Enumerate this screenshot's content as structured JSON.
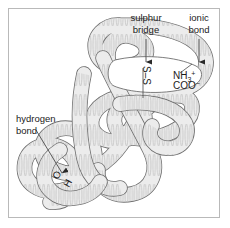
{
  "figure": {
    "type": "diagram",
    "frame_color": "#b9b9b9",
    "background_color": "#ffffff",
    "chain_fill": "#e8e8e8",
    "chain_stroke": "#6f6f6f",
    "coil_tick_color": "#c2c2c2",
    "text_color": "#1b1b1b",
    "leader_color": "#4a4a4a"
  },
  "annotations": {
    "sulphur_bridge": {
      "line1": "sulphur",
      "line2": "bridge",
      "pointer": "arrow-down"
    },
    "ionic_bond": {
      "line1": "ionic",
      "line2": "bond",
      "pointer": "arrow-down"
    },
    "hydrogen_bond": {
      "line1": "hydrogen",
      "line2": "bond",
      "pointer": "arrow-diagonal"
    }
  },
  "chem_labels": {
    "disulphide": {
      "atom1": "S",
      "dash": "–",
      "atom2": "S",
      "full": "S–S",
      "orientation": "vertical"
    },
    "ammonium": {
      "base": "NH",
      "subscript": "3",
      "superscript": "+",
      "full": "NH3+"
    },
    "carboxylate": {
      "base": "COO",
      "superscript": "–",
      "full": "COO–"
    },
    "hydrogen_bond_pair": {
      "donor": "O",
      "acceptor": "H",
      "orientation": "rotated"
    }
  }
}
